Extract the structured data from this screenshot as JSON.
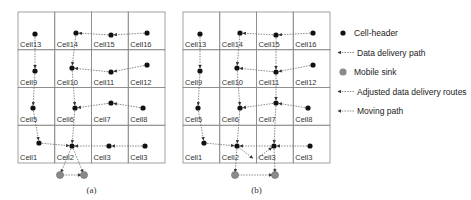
{
  "colors": {
    "grid": "#8a8a8a",
    "header": "#111111",
    "sink": "#8a8a8a",
    "path": "#555555"
  },
  "panels": [
    {
      "id": "a",
      "caption": "(a)",
      "origin": [
        18,
        12
      ],
      "cell_w": 36.75,
      "cell_h": 37.75,
      "rows": [
        [
          "Cell13",
          "Cell14",
          "Cell15",
          "Cell16"
        ],
        [
          "Cell9",
          "Cell10",
          "Cell11",
          "Cell12"
        ],
        [
          "Cell5",
          "Cell6",
          "Cell7",
          "Cell8"
        ],
        [
          "Cell1",
          "Cell2",
          "Cell3",
          "Cell3"
        ]
      ],
      "headers": [
        [
          35,
          34
        ],
        [
          76,
          33
        ],
        [
          111,
          35
        ],
        [
          147,
          33
        ],
        [
          35,
          71
        ],
        [
          72,
          68
        ],
        [
          111,
          72
        ],
        [
          147,
          65
        ],
        [
          33,
          108
        ],
        [
          75,
          108
        ],
        [
          111,
          103
        ],
        [
          143,
          108
        ],
        [
          39,
          143
        ],
        [
          72,
          146
        ],
        [
          109,
          146
        ],
        [
          145,
          146
        ]
      ],
      "sinks": [
        [
          60,
          175
        ],
        [
          84,
          175
        ]
      ],
      "paths": [
        [
          [
            147,
            33
          ],
          [
            111,
            35
          ],
          [
            76,
            33
          ]
        ],
        [
          [
            147,
            65
          ],
          [
            111,
            72
          ],
          [
            72,
            68
          ]
        ],
        [
          [
            143,
            108
          ],
          [
            111,
            103
          ],
          [
            75,
            108
          ]
        ],
        [
          [
            145,
            146
          ],
          [
            109,
            146
          ],
          [
            72,
            146
          ]
        ],
        [
          [
            35,
            34
          ],
          [
            35,
            71
          ],
          [
            33,
            108
          ],
          [
            39,
            143
          ],
          [
            72,
            146
          ]
        ],
        [
          [
            76,
            33
          ],
          [
            72,
            68
          ],
          [
            75,
            108
          ],
          [
            72,
            146
          ]
        ],
        [
          [
            72,
            146
          ],
          [
            60,
            175
          ]
        ],
        [
          [
            72,
            146
          ],
          [
            84,
            175
          ]
        ],
        [
          [
            60,
            175
          ],
          [
            84,
            175
          ]
        ]
      ]
    },
    {
      "id": "b",
      "caption": "(b)",
      "origin": [
        183,
        12
      ],
      "cell_w": 36.75,
      "cell_h": 37.75,
      "rows": [
        [
          "Cell13",
          "Cell14",
          "Cell15",
          "Cell16"
        ],
        [
          "Cell9",
          "Cell10",
          "Cell11",
          "Cell12"
        ],
        [
          "Cell5",
          "Cell6",
          "Cell7",
          "Cell8"
        ],
        [
          "Cell1",
          "Cell2",
          "Cell3",
          "Cell3"
        ]
      ],
      "headers": [
        [
          200,
          34
        ],
        [
          240,
          33
        ],
        [
          276,
          35
        ],
        [
          313,
          33
        ],
        [
          200,
          71
        ],
        [
          237,
          68
        ],
        [
          276,
          72
        ],
        [
          313,
          65
        ],
        [
          198,
          108
        ],
        [
          240,
          108
        ],
        [
          276,
          103
        ],
        [
          308,
          108
        ],
        [
          204,
          143
        ],
        [
          237,
          146
        ],
        [
          274,
          146
        ],
        [
          310,
          146
        ]
      ],
      "sinks": [
        [
          235,
          175
        ],
        [
          275,
          175
        ]
      ],
      "paths": [
        [
          [
            313,
            33
          ],
          [
            276,
            35
          ],
          [
            240,
            33
          ]
        ],
        [
          [
            313,
            65
          ],
          [
            276,
            72
          ],
          [
            237,
            68
          ]
        ],
        [
          [
            308,
            108
          ],
          [
            276,
            103
          ],
          [
            240,
            108
          ]
        ],
        [
          [
            310,
            146
          ],
          [
            274,
            146
          ],
          [
            237,
            146
          ]
        ],
        [
          [
            200,
            34
          ],
          [
            200,
            71
          ],
          [
            198,
            108
          ],
          [
            204,
            143
          ],
          [
            237,
            146
          ]
        ],
        [
          [
            240,
            33
          ],
          [
            237,
            68
          ],
          [
            240,
            108
          ],
          [
            237,
            146
          ]
        ],
        [
          [
            276,
            35
          ],
          [
            276,
            72
          ],
          [
            276,
            103
          ],
          [
            274,
            146
          ]
        ],
        [
          [
            237,
            146
          ],
          [
            255,
            160
          ],
          [
            274,
            146
          ]
        ],
        [
          [
            237,
            146
          ],
          [
            235,
            175
          ]
        ],
        [
          [
            274,
            146
          ],
          [
            275,
            175
          ]
        ],
        [
          [
            235,
            175
          ],
          [
            275,
            175
          ]
        ]
      ]
    }
  ],
  "legend": {
    "items": [
      {
        "type": "header",
        "label": "Cell-header"
      },
      {
        "type": "arrow",
        "label": "Data delivery path"
      },
      {
        "type": "sink",
        "label": "Mobile sink"
      },
      {
        "type": "arrow",
        "label": "Adjusted data delivery routes"
      },
      {
        "type": "arrow",
        "label": "Moving path"
      }
    ]
  }
}
